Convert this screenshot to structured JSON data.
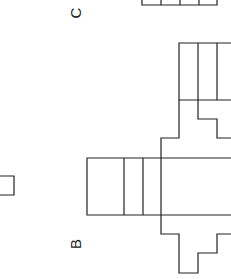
{
  "labels": {
    "c": "C",
    "b": "B"
  },
  "colors": {
    "stroke": "#222222",
    "background": "#ffffff"
  }
}
